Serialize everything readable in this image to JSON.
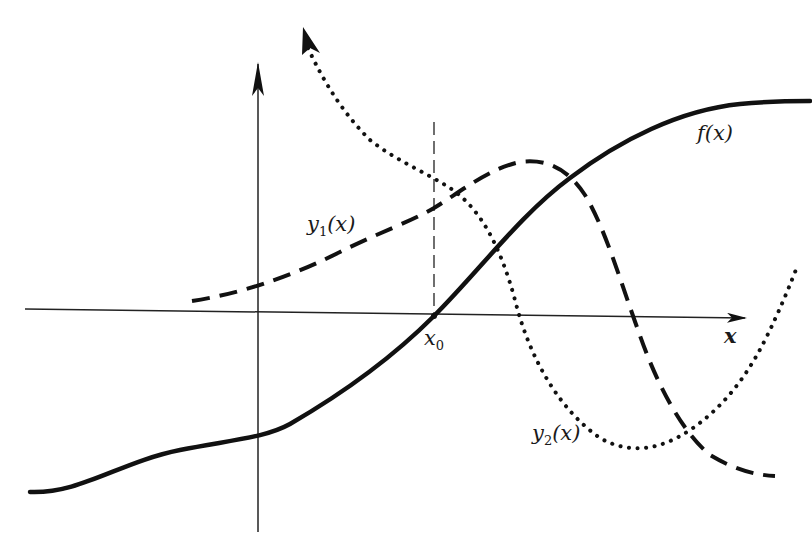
{
  "diagram": {
    "axes": {
      "x_label": "x",
      "y_axis": "vertical axis with arrow, no label"
    },
    "marker": {
      "label": "x",
      "subscript": "0",
      "description": "vertical dashed line at x0 where f(x) crosses the x-axis"
    },
    "curves": [
      {
        "name": "f",
        "label": "f(x)",
        "style": "solid",
        "description": "increasing S-shaped curve crossing x-axis at x0"
      },
      {
        "name": "y1",
        "label_base": "y",
        "label_sub": "1",
        "label_arg": "(x)",
        "style": "dashed",
        "description": "rises to a maximum then decreases below axis"
      },
      {
        "name": "y2",
        "label_base": "y",
        "label_sub": "2",
        "label_arg": "(x)",
        "style": "dotted",
        "description": "decreasing from top with arrow, minimum below axis then rising"
      }
    ],
    "colors": {
      "ink": "#111111",
      "background": "#ffffff"
    }
  }
}
